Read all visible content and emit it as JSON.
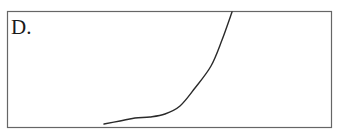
{
  "chart_data": {
    "type": "line",
    "title": "",
    "panel_label": "D.",
    "xlabel": "",
    "ylabel": "",
    "grid": false,
    "legend": null,
    "axes_ticks": false,
    "x": [
      104,
      120,
      135,
      150,
      165,
      180,
      195,
      211,
      222,
      232
    ],
    "values": [
      124,
      121,
      118,
      117,
      114,
      106,
      88,
      66,
      40,
      12
    ],
    "coordinate_note": "values are pixel-space coordinates within the 337x138 frame (y downward); no numeric axes are shown"
  },
  "colors": {
    "frame": "#666666",
    "curve": "#2a2a2a",
    "label": "#1a1a1a",
    "background": "#ffffff"
  }
}
